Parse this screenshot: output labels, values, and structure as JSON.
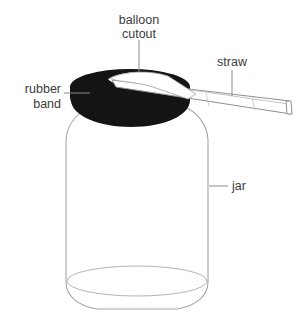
{
  "figure": {
    "background_color": "#ffffff",
    "line_color": "#9a9a9a",
    "ink_color": "#141414",
    "label_color": "#3b3b3b"
  },
  "labels": {
    "balloon_cutout": {
      "line1": "balloon",
      "line2": "cutout"
    },
    "straw": {
      "line1": "straw"
    },
    "rubber_band": {
      "line1": "rubber",
      "line2": "band"
    },
    "jar": {
      "line1": "jar"
    }
  },
  "parts": [
    {
      "name": "balloon-cutout",
      "label": "balloon cutout",
      "color": "#141414"
    },
    {
      "name": "straw",
      "label": "straw",
      "color": "#ffffff"
    },
    {
      "name": "rubber-band",
      "label": "rubber band",
      "color": "#141414"
    },
    {
      "name": "jar",
      "label": "jar",
      "color": "#ffffff"
    }
  ]
}
